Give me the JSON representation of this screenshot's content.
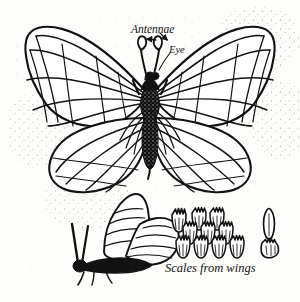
{
  "figure": {
    "medium": "pen-and-ink line drawing",
    "background_color": "#fdfdfb",
    "ink_color": "#121212"
  },
  "labels": {
    "antennae": "Antennae",
    "eye": "Eye",
    "scales_from_wings": "Scales from wings"
  },
  "subjects": [
    {
      "name": "butterfly-dorsal",
      "description": "Butterfly seen from above with wings spread, showing veined forewings and hindwings, dark speckled thorax and abdomen, and two clubbed antennae"
    },
    {
      "name": "butterfly-lateral",
      "description": "Smaller butterfly seen from the side with wings folded upward, body and legs dark and hairy"
    },
    {
      "name": "wing-scales-detail",
      "description": "Magnified cluster of overlapping wing scales arranged in rows, with two isolated scale specimens at right"
    }
  ],
  "annotations": {
    "arrow_left": "arrow pointing to left antenna",
    "arrow_right": "arrow pointing to right antenna"
  }
}
